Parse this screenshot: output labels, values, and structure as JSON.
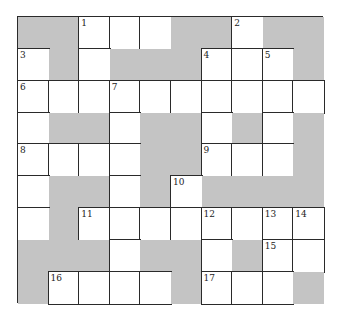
{
  "puzzle": {
    "type": "crossword",
    "columns": 10,
    "rows": 9,
    "colors": {
      "block": "#c4c4c4",
      "cell": "#ffffff",
      "line": "#2a2a2a"
    },
    "grid": [
      [
        "B",
        "B",
        "W",
        "W",
        "W",
        "B",
        "B",
        "W",
        "B",
        "B"
      ],
      [
        "W",
        "B",
        "W",
        "B",
        "B",
        "B",
        "W",
        "W",
        "W",
        "B"
      ],
      [
        "W",
        "W",
        "W",
        "W",
        "W",
        "W",
        "W",
        "W",
        "W",
        "W"
      ],
      [
        "W",
        "B",
        "B",
        "W",
        "B",
        "B",
        "W",
        "B",
        "W",
        "B"
      ],
      [
        "W",
        "W",
        "W",
        "W",
        "B",
        "B",
        "W",
        "W",
        "W",
        "B"
      ],
      [
        "W",
        "B",
        "B",
        "W",
        "B",
        "W",
        "B",
        "B",
        "B",
        "B"
      ],
      [
        "W",
        "B",
        "W",
        "W",
        "W",
        "W",
        "W",
        "W",
        "W",
        "W"
      ],
      [
        "B",
        "B",
        "B",
        "W",
        "B",
        "B",
        "W",
        "B",
        "W",
        "W"
      ],
      [
        "B",
        "W",
        "W",
        "W",
        "W",
        "B",
        "W",
        "W",
        "W",
        "B"
      ]
    ],
    "numbers": [
      {
        "row": 0,
        "col": 2,
        "label": "1"
      },
      {
        "row": 0,
        "col": 7,
        "label": "2"
      },
      {
        "row": 1,
        "col": 0,
        "label": "3"
      },
      {
        "row": 1,
        "col": 6,
        "label": "4"
      },
      {
        "row": 1,
        "col": 8,
        "label": "5"
      },
      {
        "row": 2,
        "col": 0,
        "label": "6"
      },
      {
        "row": 2,
        "col": 3,
        "label": "7"
      },
      {
        "row": 4,
        "col": 0,
        "label": "8"
      },
      {
        "row": 4,
        "col": 6,
        "label": "9"
      },
      {
        "row": 5,
        "col": 5,
        "label": "10"
      },
      {
        "row": 6,
        "col": 2,
        "label": "11"
      },
      {
        "row": 6,
        "col": 6,
        "label": "12"
      },
      {
        "row": 6,
        "col": 8,
        "label": "13"
      },
      {
        "row": 6,
        "col": 9,
        "label": "14"
      },
      {
        "row": 7,
        "col": 8,
        "label": "15"
      },
      {
        "row": 8,
        "col": 1,
        "label": "16"
      },
      {
        "row": 8,
        "col": 6,
        "label": "17"
      }
    ]
  }
}
